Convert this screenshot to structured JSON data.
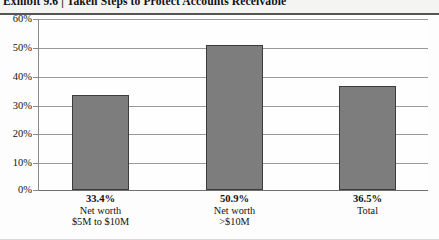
{
  "header": {
    "exhibit_label": "Exhibit 9.6",
    "separator": "|",
    "title": "Taken Steps to Protect Accounts Receivable",
    "full_title": "Exhibit 9.6  |  Taken Steps to Protect Accounts Receivable"
  },
  "chart_data": {
    "type": "bar",
    "title": "Taken Steps to Protect Accounts Receivable",
    "xlabel": "",
    "ylabel": "",
    "ylim": [
      0,
      60
    ],
    "ytick_step": 10,
    "grid": true,
    "legend": "none",
    "bar_color": "#7d7d7d",
    "bar_border_color": "#3c3c3c",
    "categories": [
      "Net worth $5M to $10M",
      "Net worth >$10M",
      "Total"
    ],
    "values": [
      33.4,
      50.9,
      36.5
    ],
    "value_labels": [
      "33.4%",
      "50.9%",
      "36.5%"
    ],
    "ytick_labels": [
      "60%",
      "50%",
      "40%",
      "30%",
      "20%",
      "10%",
      "0%"
    ],
    "ytick_values": [
      60,
      50,
      40,
      30,
      20,
      10,
      0
    ],
    "bars": [
      {
        "value": 33.4,
        "value_label": "33.4%",
        "category_line1": "Net worth",
        "category_line2": "$5M to $10M"
      },
      {
        "value": 50.9,
        "value_label": "50.9%",
        "category_line1": "Net worth",
        "category_line2": ">$10M"
      },
      {
        "value": 36.5,
        "value_label": "36.5%",
        "category_line1": "Total",
        "category_line2": ""
      }
    ]
  }
}
